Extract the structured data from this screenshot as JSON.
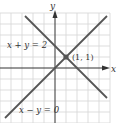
{
  "figure": {
    "axes": {
      "x_label": "x",
      "y_label": "y"
    },
    "grid": {
      "on": true,
      "color": "#d4d4d4",
      "cell_px": 11
    },
    "lines": [
      {
        "equation": "x + y = 2",
        "label": "x + y = 2",
        "color": "#555555"
      },
      {
        "equation": "x − y = 0",
        "label": "x − y = 0",
        "color": "#555555"
      }
    ],
    "intersection": {
      "label": "(1, 1)",
      "x": 1,
      "y": 1,
      "color": "#555555"
    }
  }
}
